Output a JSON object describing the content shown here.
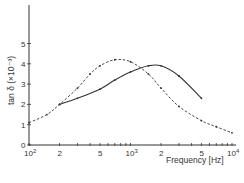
{
  "chart_data": {
    "type": "line",
    "title": "",
    "xlabel": "Frequency [Hz]",
    "ylabel": "tan δ (×10⁻³)",
    "xscale": "log",
    "xlim": [
      100,
      10000
    ],
    "ylim": [
      0,
      6
    ],
    "x_ticks": [
      "10²",
      "2",
      "5",
      "10³",
      "2",
      "5",
      "10⁴"
    ],
    "y_ticks": [
      "0",
      "1",
      "2",
      "3",
      "4",
      "5"
    ],
    "grid": false,
    "legend": null,
    "series": [
      {
        "name": "solid",
        "style": "solid",
        "x": [
          200,
          300,
          500,
          700,
          1000,
          1500,
          2000,
          3000,
          5000
        ],
        "y": [
          2.0,
          2.3,
          2.75,
          3.2,
          3.6,
          3.9,
          3.9,
          3.4,
          2.3
        ]
      },
      {
        "name": "dashed",
        "style": "dashed",
        "x": [
          100,
          150,
          200,
          300,
          400,
          500,
          700,
          1000,
          1500,
          2000,
          3000,
          5000,
          7000,
          10000
        ],
        "y": [
          1.1,
          1.5,
          2.0,
          2.8,
          3.5,
          3.9,
          4.2,
          4.1,
          3.5,
          2.8,
          1.9,
          1.2,
          0.9,
          0.6
        ]
      }
    ]
  },
  "labels": {
    "ylabel": "tan δ (×10⁻³)",
    "xlabel": "Frequency [Hz]",
    "xt": [
      "10",
      "2",
      "5",
      "10",
      "2",
      "5",
      "10"
    ],
    "xt_sup": [
      "2",
      "",
      "",
      "3",
      "",
      "",
      "4"
    ],
    "yt": [
      "0",
      "1",
      "2",
      "3",
      "4",
      "5"
    ]
  }
}
